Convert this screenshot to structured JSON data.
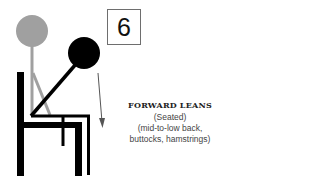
{
  "step_number": "6",
  "caption": {
    "title": "FORWARD LEANS",
    "subtitle": "(Seated)",
    "targets_line1": "(mid-to-low back,",
    "targets_line2": "buttocks, hamstrings)"
  },
  "colors": {
    "start_pose": "#a0a0a0",
    "end_pose": "#000000",
    "chair": "#000000",
    "arrow": "#555555",
    "box_border": "#6e6e6e"
  },
  "icons": {
    "motion_arrow": "down-arrow",
    "figure_start": "seated-upright-figure",
    "figure_end": "seated-forward-lean-figure",
    "chair": "chair"
  }
}
